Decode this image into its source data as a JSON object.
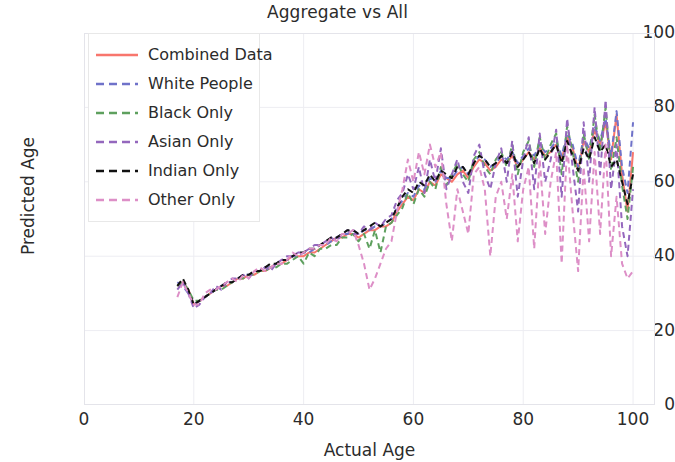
{
  "chart_data": {
    "type": "line",
    "title": "Aggregate vs All",
    "xlabel": "Actual Age",
    "ylabel": "Predicted Age",
    "xlim": [
      0,
      104
    ],
    "ylim": [
      0,
      100
    ],
    "xticks": [
      0,
      20,
      40,
      60,
      80,
      100
    ],
    "yticks": [
      0,
      20,
      40,
      60,
      80,
      100
    ],
    "grid": true,
    "legend_position": "upper left",
    "x": [
      17,
      18,
      19,
      20,
      21,
      22,
      23,
      24,
      25,
      26,
      27,
      28,
      29,
      30,
      31,
      32,
      33,
      34,
      35,
      36,
      37,
      38,
      39,
      40,
      41,
      42,
      43,
      44,
      45,
      46,
      47,
      48,
      49,
      50,
      51,
      52,
      53,
      54,
      55,
      56,
      57,
      58,
      59,
      60,
      61,
      62,
      63,
      64,
      65,
      66,
      67,
      68,
      69,
      70,
      71,
      72,
      73,
      74,
      75,
      76,
      77,
      78,
      79,
      80,
      81,
      82,
      83,
      84,
      85,
      86,
      87,
      88,
      89,
      90,
      91,
      92,
      93,
      94,
      95,
      96,
      97,
      98,
      99,
      100
    ],
    "series": [
      {
        "name": "Combined Data",
        "color": "#f8766d",
        "style": "solid",
        "values": [
          32,
          33,
          31,
          27,
          28,
          29,
          30,
          31,
          32,
          32,
          33,
          34,
          34,
          35,
          35,
          36,
          36,
          37,
          38,
          38,
          39,
          40,
          40,
          40,
          41,
          41,
          42,
          43,
          44,
          45,
          45,
          46,
          46,
          45,
          46,
          47,
          47,
          48,
          48,
          49,
          52,
          54,
          56,
          55,
          58,
          57,
          60,
          59,
          62,
          61,
          60,
          62,
          63,
          61,
          64,
          66,
          65,
          63,
          64,
          66,
          65,
          67,
          64,
          66,
          68,
          66,
          69,
          67,
          68,
          70,
          66,
          72,
          69,
          63,
          71,
          68,
          74,
          70,
          76,
          66,
          78,
          62,
          52,
          68
        ]
      },
      {
        "name": "White People",
        "color": "#6f72c9",
        "style": "dashed",
        "values": [
          33,
          32,
          30,
          27,
          28,
          29,
          30,
          31,
          32,
          33,
          33,
          34,
          35,
          35,
          36,
          36,
          37,
          37,
          38,
          39,
          39,
          40,
          40,
          41,
          41,
          42,
          43,
          43,
          44,
          45,
          46,
          46,
          47,
          46,
          47,
          47,
          48,
          48,
          49,
          50,
          53,
          55,
          57,
          56,
          59,
          58,
          61,
          60,
          63,
          61,
          61,
          63,
          64,
          62,
          65,
          67,
          66,
          64,
          65,
          67,
          66,
          68,
          65,
          67,
          69,
          67,
          70,
          68,
          69,
          71,
          67,
          73,
          70,
          64,
          72,
          69,
          75,
          71,
          77,
          67,
          79,
          64,
          57,
          76
        ]
      },
      {
        "name": "Black Only",
        "color": "#5ea05e",
        "style": "dashed",
        "values": [
          32,
          33,
          31,
          28,
          28,
          29,
          30,
          31,
          31,
          32,
          33,
          34,
          34,
          35,
          35,
          36,
          36,
          37,
          37,
          38,
          38,
          39,
          40,
          38,
          41,
          40,
          42,
          42,
          43,
          43,
          45,
          45,
          46,
          44,
          46,
          42,
          47,
          41,
          48,
          49,
          51,
          53,
          57,
          54,
          58,
          56,
          60,
          58,
          64,
          59,
          62,
          65,
          62,
          60,
          66,
          68,
          64,
          62,
          66,
          68,
          64,
          70,
          62,
          68,
          71,
          64,
          72,
          66,
          70,
          73,
          62,
          75,
          68,
          60,
          73,
          66,
          78,
          68,
          80,
          63,
          72,
          59,
          50,
          64
        ]
      },
      {
        "name": "Asian Only",
        "color": "#9467bd",
        "style": "dashed",
        "values": [
          31,
          33,
          30,
          26,
          27,
          29,
          30,
          32,
          31,
          33,
          34,
          34,
          35,
          34,
          36,
          36,
          37,
          36,
          38,
          39,
          40,
          40,
          41,
          41,
          42,
          43,
          43,
          44,
          45,
          44,
          46,
          47,
          46,
          46,
          48,
          47,
          49,
          48,
          50,
          51,
          55,
          57,
          62,
          58,
          64,
          57,
          66,
          60,
          69,
          58,
          62,
          66,
          60,
          57,
          67,
          70,
          62,
          58,
          65,
          69,
          60,
          71,
          56,
          66,
          72,
          58,
          73,
          60,
          66,
          74,
          56,
          77,
          64,
          52,
          76,
          60,
          80,
          62,
          82,
          58,
          70,
          48,
          40,
          58
        ]
      },
      {
        "name": "Indian Only",
        "color": "#111111",
        "style": "dashed",
        "values": [
          32,
          34,
          31,
          27,
          28,
          29,
          30,
          31,
          32,
          33,
          33,
          34,
          35,
          35,
          36,
          36,
          37,
          38,
          38,
          39,
          39,
          40,
          41,
          41,
          42,
          42,
          43,
          44,
          45,
          45,
          46,
          47,
          47,
          46,
          47,
          48,
          49,
          48,
          49,
          50,
          53,
          56,
          58,
          57,
          60,
          59,
          62,
          60,
          63,
          62,
          61,
          64,
          64,
          62,
          65,
          67,
          66,
          64,
          65,
          67,
          65,
          68,
          64,
          66,
          68,
          65,
          69,
          66,
          68,
          70,
          65,
          71,
          67,
          63,
          69,
          66,
          72,
          68,
          70,
          64,
          66,
          60,
          54,
          62
        ]
      },
      {
        "name": "Other Only",
        "color": "#dd8fc7",
        "style": "dashed",
        "values": [
          29,
          33,
          30,
          27,
          27,
          30,
          31,
          31,
          32,
          33,
          34,
          33,
          35,
          34,
          36,
          37,
          36,
          37,
          38,
          38,
          39,
          41,
          40,
          41,
          42,
          42,
          43,
          43,
          45,
          44,
          46,
          46,
          47,
          43,
          38,
          31,
          34,
          38,
          42,
          44,
          52,
          58,
          66,
          60,
          68,
          62,
          70,
          64,
          68,
          54,
          44,
          58,
          52,
          46,
          62,
          64,
          58,
          40,
          56,
          60,
          50,
          62,
          44,
          58,
          64,
          42,
          66,
          46,
          60,
          68,
          38,
          70,
          52,
          36,
          64,
          44,
          68,
          46,
          70,
          40,
          56,
          38,
          34,
          36
        ]
      }
    ]
  },
  "axes": {
    "x_tick_labels": [
      "0",
      "20",
      "40",
      "60",
      "80",
      "100"
    ],
    "y_tick_labels": [
      "0",
      "20",
      "40",
      "60",
      "80",
      "100"
    ]
  },
  "legend": {
    "items": [
      {
        "label": "Combined Data",
        "color": "#f8766d",
        "style": "solid"
      },
      {
        "label": "White People",
        "color": "#6f72c9",
        "style": "dashed"
      },
      {
        "label": "Black Only",
        "color": "#5ea05e",
        "style": "dashed"
      },
      {
        "label": "Asian Only",
        "color": "#9467bd",
        "style": "dashed"
      },
      {
        "label": "Indian Only",
        "color": "#111111",
        "style": "dashed"
      },
      {
        "label": "Other Only",
        "color": "#dd8fc7",
        "style": "dashed"
      }
    ]
  },
  "colors": {
    "background": "#ffffff",
    "text": "#2b2b2b",
    "grid": "#ededf2",
    "spine": "#e4e4ea"
  }
}
